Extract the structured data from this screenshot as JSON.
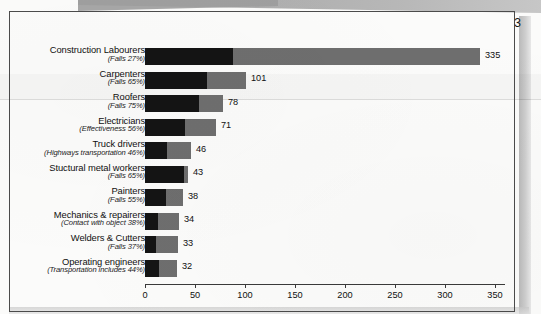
{
  "document": {
    "page_number": "3"
  },
  "chart_data": {
    "type": "bar",
    "orientation": "horizontal",
    "stacked": true,
    "title": "",
    "xlabel": "",
    "ylabel": "",
    "xlim": [
      0,
      360
    ],
    "xticks": [
      0,
      50,
      100,
      150,
      200,
      250,
      300,
      350
    ],
    "xtick_labels": [
      "0",
      "50",
      "100",
      "150",
      "200",
      "250",
      "300",
      "350"
    ],
    "grid": false,
    "legend": null,
    "colors": {
      "segment_dark": "#141414",
      "segment_light": "#6e6e6e",
      "axis": "#3a3a3a",
      "text": "#101010",
      "page_border": "#4b4b4b",
      "paper": "#fbfbfa"
    },
    "categories": [
      "Construction Labourers",
      "Carpenters",
      "Roofers",
      "Electricians",
      "Truck drivers",
      "Stuctural metal workers",
      "Painters",
      "Mechanics & repairers",
      "Welders & Cutters",
      "Operating engineers"
    ],
    "sublabels": [
      "(Falls 27%)",
      "(Falls 65%)",
      "(Falls 75%)",
      "(Effectiveness 56%)",
      "(Highways transportation 46%)",
      "(Falls 65%)",
      "(Falls 55%)",
      "(Contact with object 38%)",
      "(Falls 37%)",
      "(Transportation includes 44%)"
    ],
    "values": [
      335,
      101,
      78,
      71,
      46,
      43,
      38,
      34,
      33,
      32
    ],
    "value_labels": [
      "335",
      "101",
      "78",
      "71",
      "46",
      "43",
      "38",
      "34",
      "33",
      "32"
    ],
    "series": [
      {
        "name": "dark-segment",
        "values": [
          88,
          62,
          54,
          40,
          22,
          39,
          21,
          13,
          11,
          14
        ]
      },
      {
        "name": "light-segment",
        "values": [
          247,
          39,
          24,
          31,
          24,
          4,
          17,
          21,
          22,
          18
        ]
      }
    ],
    "bars": [
      {
        "category": "Construction Labourers",
        "sublabel": "(Falls 27%)",
        "total": 335,
        "label": "335",
        "dark": 88,
        "light": 247
      },
      {
        "category": "Carpenters",
        "sublabel": "(Falls 65%)",
        "total": 101,
        "label": "101",
        "dark": 62,
        "light": 39
      },
      {
        "category": "Roofers",
        "sublabel": "(Falls 75%)",
        "total": 78,
        "label": "78",
        "dark": 54,
        "light": 24
      },
      {
        "category": "Electricians",
        "sublabel": "(Effectiveness 56%)",
        "total": 71,
        "label": "71",
        "dark": 40,
        "light": 31
      },
      {
        "category": "Truck drivers",
        "sublabel": "(Highways transportation 46%)",
        "total": 46,
        "label": "46",
        "dark": 22,
        "light": 24
      },
      {
        "category": "Stuctural metal workers",
        "sublabel": "(Falls 65%)",
        "total": 43,
        "label": "43",
        "dark": 39,
        "light": 4
      },
      {
        "category": "Painters",
        "sublabel": "(Falls 55%)",
        "total": 38,
        "label": "38",
        "dark": 21,
        "light": 17
      },
      {
        "category": "Mechanics & repairers",
        "sublabel": "(Contact with object 38%)",
        "total": 34,
        "label": "34",
        "dark": 13,
        "light": 21
      },
      {
        "category": "Welders & Cutters",
        "sublabel": "(Falls 37%)",
        "total": 33,
        "label": "33",
        "dark": 11,
        "light": 22
      },
      {
        "category": "Operating engineers",
        "sublabel": "(Transportation includes 44%)",
        "total": 32,
        "label": "32",
        "dark": 14,
        "light": 18
      }
    ]
  }
}
